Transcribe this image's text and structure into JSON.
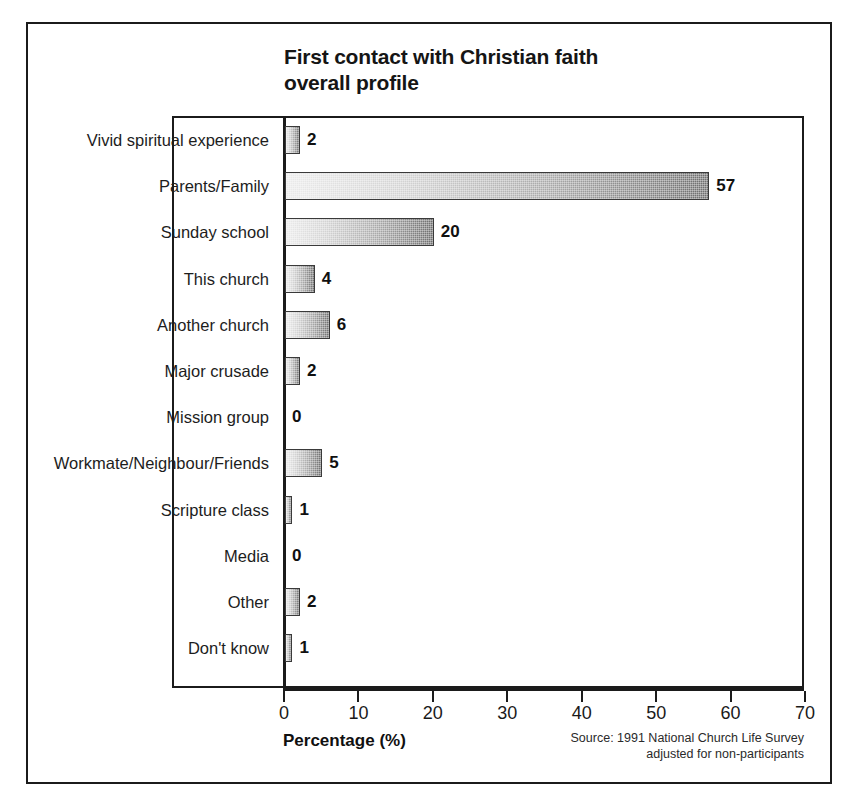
{
  "chart_data": {
    "type": "bar",
    "orientation": "horizontal",
    "title": "First contact with Christian faith\noverall profile",
    "title_line1": "First contact with Christian faith",
    "title_line2": "overall profile",
    "xlabel": "Percentage (%)",
    "ylabel": "",
    "xlim": [
      0,
      70
    ],
    "xticks": [
      0,
      10,
      20,
      30,
      40,
      50,
      60,
      70
    ],
    "xtick_labels": [
      "0",
      "10",
      "20",
      "30",
      "40",
      "50",
      "60",
      "70"
    ],
    "grid": false,
    "legend": false,
    "categories": [
      "Vivid spiritual experience",
      "Parents/Family",
      "Sunday school",
      "This church",
      "Another church",
      "Major crusade",
      "Mission group",
      "Workmate/Neighbour/Friends",
      "Scripture class",
      "Media",
      "Other",
      "Don't know"
    ],
    "values": [
      2,
      57,
      20,
      4,
      6,
      2,
      0,
      5,
      1,
      0,
      2,
      1
    ],
    "value_labels": [
      "2",
      "57",
      "20",
      "4",
      "6",
      "2",
      "0",
      "5",
      "1",
      "0",
      "2",
      "1"
    ],
    "annotations": {
      "source_line1": "Source: 1991 National Church Life Survey",
      "source_line2": "adjusted for non-participants",
      "source": "Source: 1991 National Church Life Survey\nadjusted for non-participants"
    },
    "colors": {
      "bar_gradient_start": "#ebebeb",
      "bar_gradient_end": "#6e6e6e",
      "bar_border": "#3a3a3a",
      "axis": "#1b1b1b",
      "text": "#111111",
      "background": "#ffffff"
    }
  }
}
